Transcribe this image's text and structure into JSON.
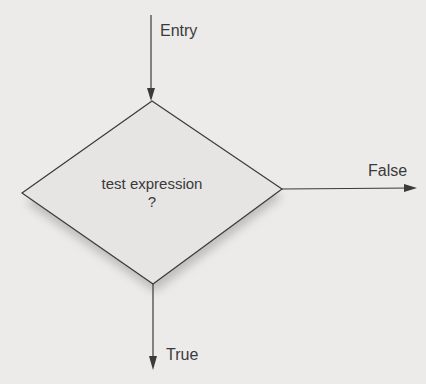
{
  "diagram": {
    "decision": {
      "line1": "test expression",
      "line2": "?"
    },
    "entry_label": "Entry",
    "false_label": "False",
    "true_label": "True",
    "colors": {
      "background": "#ecebea",
      "stroke": "#3a3a3a",
      "fill": "#e6e5e4",
      "shadow": "#9a9898"
    }
  }
}
